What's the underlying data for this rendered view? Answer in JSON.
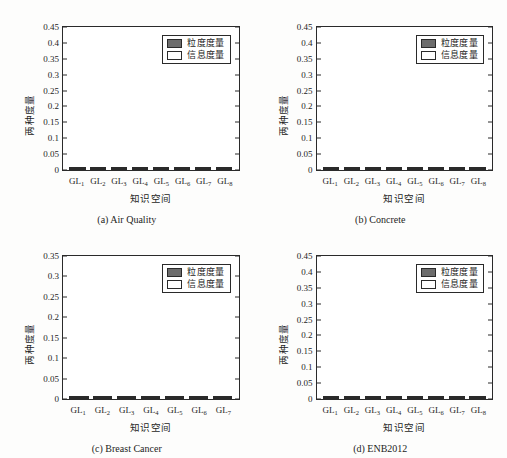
{
  "figure": {
    "legend": {
      "granularity_label": "粒度度量",
      "information_label": "信息度量",
      "granularity_color": "#6c6c6c",
      "information_color": "#ffffff"
    },
    "axis_titles": {
      "y": "两种度量",
      "x": "知识空间"
    }
  },
  "chart_data": [
    {
      "type": "bar",
      "panel": "a",
      "title": "(a) Air Quality",
      "xlabel": "知识空间",
      "ylabel": "两种度量",
      "ylim": [
        0,
        0.45
      ],
      "yticks": [
        0,
        0.05,
        0.1,
        0.15,
        0.2,
        0.25,
        0.3,
        0.35,
        0.4,
        0.45
      ],
      "ytick_labels": [
        "0",
        "0.05",
        "0.1",
        "0.15",
        "0.2",
        "0.25",
        "0.3",
        "0.35",
        "0.4",
        "0.45"
      ],
      "categories": [
        "GL1",
        "GL2",
        "GL3",
        "GL4",
        "GL5",
        "GL6",
        "GL7",
        "GL8"
      ],
      "category_labels": [
        "GL",
        "GL",
        "GL",
        "GL",
        "GL",
        "GL",
        "GL",
        "GL"
      ],
      "category_subs": [
        "1",
        "2",
        "3",
        "4",
        "5",
        "6",
        "7",
        "8"
      ],
      "stack_total": 0.44,
      "grid": false,
      "legend_position": "upper right",
      "series": [
        {
          "name": "粒度度量",
          "values": [
            0.392,
            0.193,
            0.122,
            0.051,
            0.028,
            0.016,
            0.01,
            0.006
          ]
        },
        {
          "name": "信息度量",
          "values": [
            0.048,
            0.247,
            0.318,
            0.389,
            0.412,
            0.424,
            0.43,
            0.434
          ]
        }
      ]
    },
    {
      "type": "bar",
      "panel": "b",
      "title": "(b) Concrete",
      "xlabel": "知识空间",
      "ylabel": "两种度量",
      "ylim": [
        0,
        0.45
      ],
      "yticks": [
        0,
        0.05,
        0.1,
        0.15,
        0.2,
        0.25,
        0.3,
        0.35,
        0.4,
        0.45
      ],
      "ytick_labels": [
        "0",
        "0.05",
        "0.1",
        "0.15",
        "0.2",
        "0.25",
        "0.3",
        "0.35",
        "0.4",
        "0.45"
      ],
      "categories": [
        "GL1",
        "GL2",
        "GL3",
        "GL4",
        "GL5",
        "GL6",
        "GL7",
        "GL8"
      ],
      "category_labels": [
        "GL",
        "GL",
        "GL",
        "GL",
        "GL",
        "GL",
        "GL",
        "GL"
      ],
      "category_subs": [
        "1",
        "2",
        "3",
        "4",
        "5",
        "6",
        "7",
        "8"
      ],
      "stack_total": 0.44,
      "grid": false,
      "legend_position": "upper right",
      "series": [
        {
          "name": "粒度度量",
          "values": [
            0.266,
            0.11,
            0.043,
            0.023,
            0.008,
            0.003,
            0.002,
            0.002
          ]
        },
        {
          "name": "信息度量",
          "values": [
            0.174,
            0.33,
            0.397,
            0.417,
            0.432,
            0.437,
            0.438,
            0.438
          ]
        }
      ]
    },
    {
      "type": "bar",
      "panel": "c",
      "title": "(c) Breast Cancer",
      "xlabel": "知识空间",
      "ylabel": "两种度量",
      "ylim": [
        0,
        0.35
      ],
      "yticks": [
        0,
        0.05,
        0.1,
        0.15,
        0.2,
        0.25,
        0.3,
        0.35
      ],
      "ytick_labels": [
        "0",
        "0.05",
        "0.1",
        "0.15",
        "0.2",
        "0.25",
        "0.3",
        "0.35"
      ],
      "categories": [
        "GL1",
        "GL2",
        "GL3",
        "GL4",
        "GL5",
        "GL6",
        "GL7"
      ],
      "category_labels": [
        "GL",
        "GL",
        "GL",
        "GL",
        "GL",
        "GL",
        "GL"
      ],
      "category_subs": [
        "1",
        "2",
        "3",
        "4",
        "5",
        "6",
        "7"
      ],
      "stack_total": 0.344,
      "grid": false,
      "legend_position": "upper right",
      "series": [
        {
          "name": "粒度度量",
          "values": [
            0.207,
            0.054,
            0.021,
            0.011,
            0.003,
            0.001,
            0.001
          ]
        },
        {
          "name": "信息度量",
          "values": [
            0.137,
            0.29,
            0.323,
            0.333,
            0.341,
            0.343,
            0.343
          ]
        }
      ]
    },
    {
      "type": "bar",
      "panel": "d",
      "title": "(d) ENB2012",
      "xlabel": "知识空间",
      "ylabel": "两种度量",
      "ylim": [
        0,
        0.45
      ],
      "yticks": [
        0,
        0.05,
        0.1,
        0.15,
        0.2,
        0.25,
        0.3,
        0.35,
        0.4,
        0.45
      ],
      "ytick_labels": [
        "0",
        "0.05",
        "0.1",
        "0.15",
        "0.2",
        "0.25",
        "0.3",
        "0.35",
        "0.4",
        "0.45"
      ],
      "categories": [
        "GL1",
        "GL2",
        "GL3",
        "GL4",
        "GL5",
        "GL6",
        "GL7",
        "GL8"
      ],
      "category_labels": [
        "GL",
        "GL",
        "GL",
        "GL",
        "GL",
        "GL",
        "GL",
        "GL"
      ],
      "category_subs": [
        "1",
        "2",
        "3",
        "4",
        "5",
        "6",
        "7",
        "8"
      ],
      "stack_total": 0.44,
      "grid": false,
      "legend_position": "upper right",
      "series": [
        {
          "name": "粒度度量",
          "values": [
            0.122,
            0.103,
            0.103,
            0.087,
            0.051,
            0.016,
            0.003,
            0.001
          ]
        },
        {
          "name": "信息度量",
          "values": [
            0.318,
            0.337,
            0.337,
            0.353,
            0.389,
            0.424,
            0.437,
            0.439
          ]
        }
      ]
    }
  ]
}
